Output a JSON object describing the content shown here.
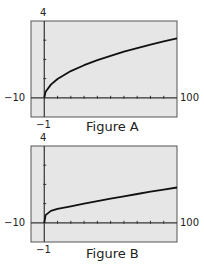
{
  "chart_data": [
    {
      "type": "line",
      "title": "Figure A",
      "xlabel": "",
      "ylabel": "",
      "xlim": [
        -10,
        100
      ],
      "ylim": [
        -1,
        4
      ],
      "x_ticks_every": 10,
      "y_ticks_every": 1,
      "tick_labels": {
        "xmin": "−10",
        "xmax": "100",
        "ymin": "−1",
        "ymax": "4"
      },
      "grid": false,
      "series": [
        {
          "name": "curve",
          "x": [
            0,
            1,
            5,
            10,
            20,
            30,
            40,
            50,
            60,
            70,
            80,
            90,
            100
          ],
          "values": [
            0,
            0.31,
            0.69,
            0.98,
            1.39,
            1.7,
            1.96,
            2.19,
            2.4,
            2.59,
            2.77,
            2.94,
            3.1
          ]
        }
      ]
    },
    {
      "type": "line",
      "title": "Figure B",
      "xlabel": "",
      "ylabel": "",
      "xlim": [
        -10,
        100
      ],
      "ylim": [
        -1,
        4
      ],
      "x_ticks_every": 10,
      "y_ticks_every": 1,
      "tick_labels": {
        "xmin": "−10",
        "xmax": "100",
        "ymin": "−1",
        "ymax": "4"
      },
      "grid": false,
      "series": [
        {
          "name": "curve",
          "x": [
            0,
            1,
            5,
            10,
            20,
            30,
            40,
            50,
            60,
            70,
            80,
            90,
            100
          ],
          "values": [
            0,
            0.4,
            0.62,
            0.73,
            0.86,
            1.0,
            1.13,
            1.26,
            1.38,
            1.5,
            1.62,
            1.73,
            1.84
          ]
        }
      ]
    }
  ],
  "figures": [
    {
      "caption": "Figure A",
      "ymax": "4",
      "xmin": "−10",
      "xmax": "100",
      "ymin": "−1"
    },
    {
      "caption": "Figure B",
      "ymax": "4",
      "xmin": "−10",
      "xmax": "100",
      "ymin": "−1"
    }
  ],
  "colors": {
    "plot_bg": "#e6e6e6",
    "frame": "#555555",
    "curve": "#111111"
  }
}
